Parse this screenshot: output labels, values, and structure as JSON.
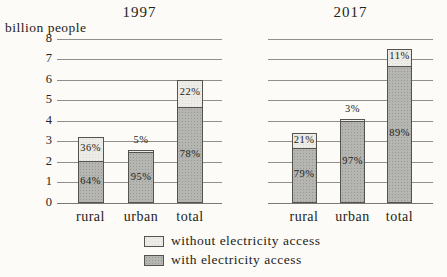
{
  "figure": {
    "unit_label": "billion people"
  },
  "chart_data": {
    "type": "bar",
    "stacked": true,
    "ylabel": "billion people",
    "ylim": [
      0,
      8
    ],
    "yticks": [
      0,
      1,
      2,
      3,
      4,
      5,
      6,
      7,
      8
    ],
    "grid": "horizontal",
    "legend_position": "bottom",
    "legend": [
      {
        "label": "without electricity access",
        "color": "#edece7"
      },
      {
        "label": "with electricity access",
        "color": "#b5b5b1"
      }
    ],
    "panels": [
      {
        "title": "1997",
        "categories": [
          "rural",
          "urban",
          "total"
        ],
        "bars": [
          {
            "category": "rural",
            "total_billion": 3.2,
            "with_pct": 64,
            "without_pct": 36,
            "with_label": "64%",
            "without_label": "36%"
          },
          {
            "category": "urban",
            "total_billion": 2.6,
            "with_pct": 95,
            "without_pct": 5,
            "with_label": "95%",
            "without_label": "5%"
          },
          {
            "category": "total",
            "total_billion": 6.0,
            "with_pct": 78,
            "without_pct": 22,
            "with_label": "78%",
            "without_label": "22%"
          }
        ]
      },
      {
        "title": "2017",
        "categories": [
          "rural",
          "urban",
          "total"
        ],
        "bars": [
          {
            "category": "rural",
            "total_billion": 3.4,
            "with_pct": 79,
            "without_pct": 21,
            "with_label": "79%",
            "without_label": "21%"
          },
          {
            "category": "urban",
            "total_billion": 4.1,
            "with_pct": 97,
            "without_pct": 3,
            "with_label": "97%",
            "without_label": "3%"
          },
          {
            "category": "total",
            "total_billion": 7.5,
            "with_pct": 89,
            "without_pct": 11,
            "with_label": "89%",
            "without_label": "11%"
          }
        ]
      }
    ],
    "colors": {
      "with_fill": "#b5b5b1",
      "without_fill": "#edece7",
      "bar_border": "#55534e",
      "gridline": "#908f8b",
      "text": "#232320"
    }
  }
}
